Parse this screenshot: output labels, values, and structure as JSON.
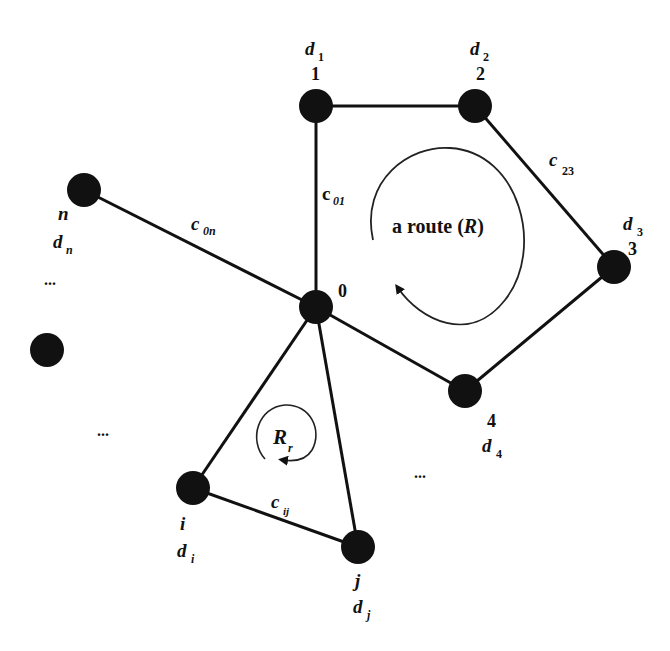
{
  "diagram": {
    "type": "vehicle-routing-graph",
    "colors": {
      "node": "#111111",
      "edge": "#111111",
      "background": "#ffffff"
    },
    "nodes": [
      {
        "id": "0",
        "label": "0",
        "demand": "",
        "x": 316,
        "y": 307
      },
      {
        "id": "1",
        "label": "1",
        "demand_base": "d",
        "demand_sub": "1",
        "x": 316,
        "y": 106
      },
      {
        "id": "2",
        "label": "2",
        "demand_base": "d",
        "demand_sub": "2",
        "x": 475,
        "y": 106
      },
      {
        "id": "3",
        "label": "3",
        "demand_base": "d",
        "demand_sub": "3",
        "x": 614,
        "y": 267
      },
      {
        "id": "4",
        "label": "4",
        "demand_base": "d",
        "demand_sub": "4",
        "x": 465,
        "y": 391
      },
      {
        "id": "n",
        "label": "n",
        "demand_base": "d",
        "demand_sub": "n",
        "x": 84,
        "y": 190
      },
      {
        "id": "unlabeled",
        "label": "",
        "x": 47,
        "y": 350
      },
      {
        "id": "i",
        "label": "i",
        "demand_base": "d",
        "demand_sub": "i",
        "x": 193,
        "y": 488
      },
      {
        "id": "j",
        "label": "j",
        "demand_base": "d",
        "demand_sub": "j",
        "x": 358,
        "y": 547
      }
    ],
    "edges": [
      {
        "from": "0",
        "to": "1",
        "label_base": "c",
        "label_sub": "01"
      },
      {
        "from": "1",
        "to": "2"
      },
      {
        "from": "2",
        "to": "3",
        "label_base": "c",
        "label_sub": "23"
      },
      {
        "from": "3",
        "to": "4"
      },
      {
        "from": "4",
        "to": "0"
      },
      {
        "from": "0",
        "to": "n",
        "label_base": "c",
        "label_sub": "0n"
      },
      {
        "from": "0",
        "to": "i"
      },
      {
        "from": "i",
        "to": "j",
        "label_base": "c",
        "label_sub": "ij"
      },
      {
        "from": "j",
        "to": "0"
      }
    ],
    "routes": [
      {
        "label_prefix": "a route (",
        "label_var": "R",
        "label_suffix": ")",
        "direction": "counterclockwise"
      },
      {
        "label_base": "R",
        "label_sub": "r",
        "direction": "clockwise"
      }
    ],
    "ellipses": [
      "...",
      "...",
      "..."
    ]
  }
}
